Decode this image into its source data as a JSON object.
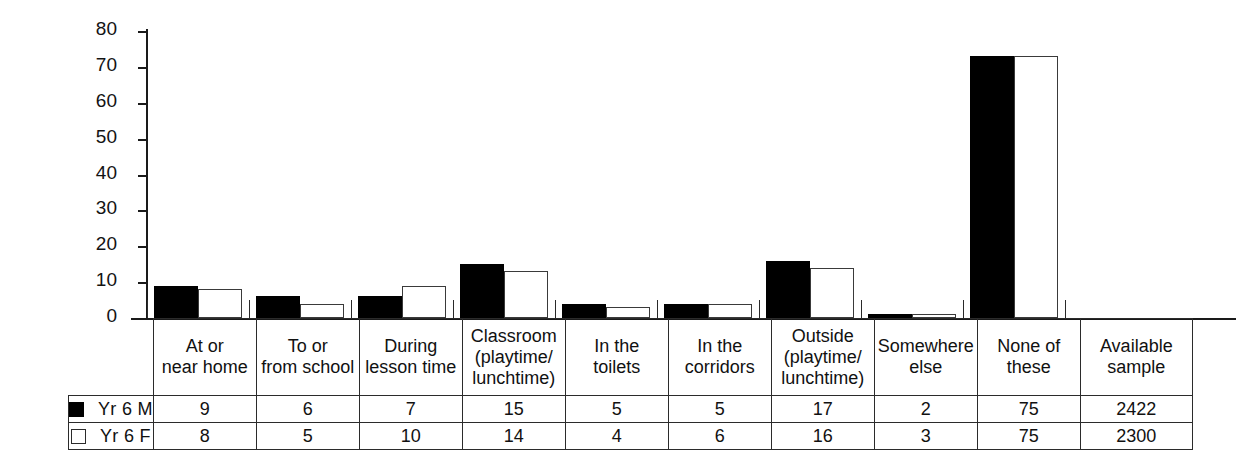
{
  "chart_data": {
    "type": "bar",
    "title": "",
    "subtitle": "",
    "xlabel": "",
    "ylabel": "",
    "ylim": [
      0,
      80
    ],
    "yticks": [
      0,
      10,
      20,
      30,
      40,
      50,
      60,
      70,
      80
    ],
    "grid": false,
    "legend_position": "table-left",
    "categories": [
      "At or near home",
      "To or from school",
      "During lesson time",
      "Classroom (playtime/lunchtime)",
      "In the toilets",
      "In the corridors",
      "Outside (playtime/lunchtime)",
      "Somewhere else",
      "None of these"
    ],
    "category_lines": [
      [
        "At or",
        "near home"
      ],
      [
        "To or",
        "from school"
      ],
      [
        "During",
        "lesson time"
      ],
      [
        "Classroom",
        "(playtime/",
        "lunchtime)"
      ],
      [
        "In the",
        "toilets"
      ],
      [
        "In the",
        "corridors"
      ],
      [
        "Outside",
        "(playtime/",
        "lunchtime)"
      ],
      [
        "Somewhere",
        "else"
      ],
      [
        "None of these"
      ]
    ],
    "series": [
      {
        "name": "Yr 6 M",
        "swatch": "filled",
        "values": [
          9,
          6,
          7,
          15,
          5,
          5,
          17,
          2,
          75
        ],
        "bar_values": [
          9,
          6,
          6,
          15,
          4,
          4,
          16,
          1,
          73
        ],
        "available_sample": 2422
      },
      {
        "name": "Yr 6 F",
        "swatch": "hollow",
        "values": [
          8,
          5,
          10,
          14,
          4,
          6,
          16,
          3,
          75
        ],
        "bar_values": [
          8,
          4,
          9,
          13,
          3,
          4,
          14,
          1,
          73
        ],
        "available_sample": 2300
      }
    ],
    "extra_column": {
      "header_lines": [
        "Available",
        "sample"
      ],
      "values": [
        2422,
        2300
      ]
    }
  },
  "colors": {
    "series_m": "#000000",
    "series_f": "#ffffff",
    "outline": "#2b2b2b",
    "axis": "#1a1a1a",
    "background": "#ffffff"
  }
}
